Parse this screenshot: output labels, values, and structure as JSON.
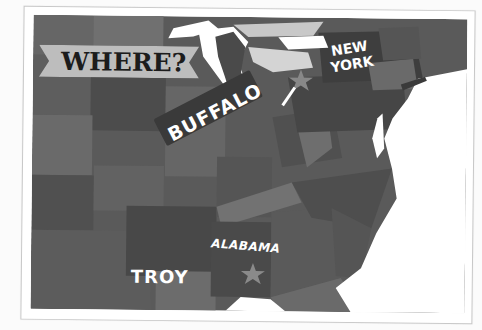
{
  "map": {
    "title": "WHERE?",
    "region": "Eastern United States",
    "labels": {
      "buffalo": "BUFFALO",
      "new_york_line1": "NEW",
      "new_york_line2": "YORK",
      "alabama": "ALABAMA",
      "troy": "TROY"
    },
    "markers": [
      {
        "name": "buffalo-star",
        "shape": "star",
        "label": "BUFFALO"
      },
      {
        "name": "troy-star",
        "shape": "star",
        "label": "TROY"
      }
    ],
    "colors": {
      "background": "#fbfbfb",
      "card": "#ffffff",
      "water": "#ffffff",
      "land_dark": "#4a4a4a",
      "land_mid": "#5e5e5e",
      "land_light": "#747474",
      "banner": "#bdbdbd",
      "banner_text": "#1c1c1c",
      "label_text": "#ffffff",
      "tag": "#3a3a3a"
    }
  }
}
